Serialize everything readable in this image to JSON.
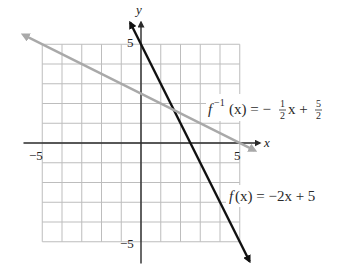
{
  "chart_data": {
    "type": "line",
    "title": "",
    "xlabel": "x",
    "ylabel": "y",
    "xlim": [
      -5,
      5
    ],
    "ylim": [
      -5,
      5
    ],
    "grid": true,
    "tick_labels": {
      "x_neg": "−5",
      "x_pos": "5",
      "y_pos": "5",
      "y_neg": "−5"
    },
    "series": [
      {
        "name": "f(x) = −2x + 5",
        "slope": -2,
        "intercept": 5,
        "x_range": [
          -0.55,
          5.5
        ],
        "color": "#111111",
        "width": 2.4
      },
      {
        "name": "f⁻¹(x) = −½x + 5/2",
        "slope": -0.5,
        "intercept": 2.5,
        "x_range": [
          -5.95,
          5.75
        ],
        "color": "#a9a9a9",
        "width": 2.4
      }
    ],
    "annotations": {
      "finv": {
        "f": "f",
        "sup": "−1",
        "arg": "(x) = −",
        "frac1_num": "1",
        "frac1_den": "2",
        "mid": "x +",
        "frac2_num": "5",
        "frac2_den": "2"
      },
      "f": {
        "f": "f",
        "rest": "(x) = −2x + 5"
      }
    }
  }
}
